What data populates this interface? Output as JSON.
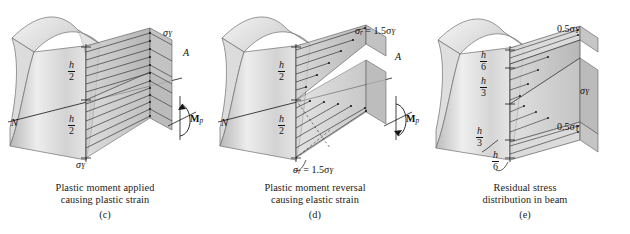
{
  "figure": {
    "type": "engineering-mechanics-figure",
    "background_color": "#ffffff",
    "ink_color": "#101010"
  },
  "panels": [
    {
      "id": "c",
      "tag": "(c)",
      "caption_line1": "Plastic moment applied",
      "caption_line2": "causing plastic strain",
      "stress_profile": "uniform",
      "labels": {
        "stress_top": "σ",
        "stress_top_sub": "Y",
        "stress_bottom": "σ",
        "stress_bottom_sub": "Y",
        "axis_n": "N",
        "axis_a": "A",
        "moment": "M",
        "moment_sub": "p"
      },
      "dimensions": [
        {
          "num": "h",
          "den": "2"
        },
        {
          "num": "h",
          "den": "2"
        }
      ]
    },
    {
      "id": "d",
      "tag": "(d)",
      "caption_line1": "Plastic moment reversal",
      "caption_line2": "causing elastic strain",
      "stress_profile": "linear",
      "labels": {
        "stress_top": "σ",
        "stress_top_sub": "r",
        "stress_top_value": " = 1.5σ",
        "stress_top_value_sub": "Y",
        "stress_bottom": "σ",
        "stress_bottom_sub": "r",
        "stress_bottom_value": " = 1.5σ",
        "stress_bottom_value_sub": "Y",
        "axis_n": "N",
        "axis_a": "A",
        "moment": "M",
        "moment_sub": "p"
      },
      "dimensions": [
        {
          "num": "h",
          "den": "2"
        },
        {
          "num": "h",
          "den": "2"
        }
      ]
    },
    {
      "id": "e",
      "tag": "(e)",
      "caption_line1": "Residual stress",
      "caption_line2": "distribution in beam",
      "stress_profile": "bowtie",
      "labels": {
        "stress_top": "0.5σ",
        "stress_top_sub": "Y",
        "stress_mid": "σ",
        "stress_mid_sub": "Y",
        "stress_bottom": "0.5σ",
        "stress_bottom_sub": "Y"
      },
      "dimensions": [
        {
          "num": "h",
          "den": "6"
        },
        {
          "num": "h",
          "den": "3"
        },
        {
          "num": "h",
          "den": "3"
        },
        {
          "num": "h",
          "den": "6"
        }
      ]
    }
  ]
}
